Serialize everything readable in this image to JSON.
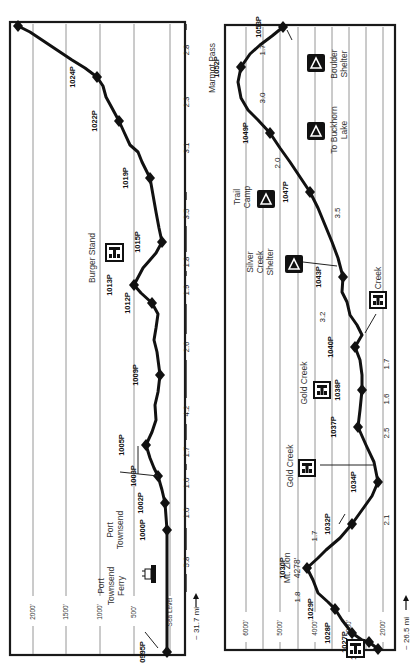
{
  "left_panel": {
    "distance_label": "~ 31.7 mi",
    "elevation_gridlines": [
      {
        "label": "2000'",
        "x": 33
      },
      {
        "label": "1500'",
        "x": 66
      },
      {
        "label": "1000'",
        "x": 100
      },
      {
        "label": "500'",
        "x": 134
      },
      {
        "label": "Sea Level",
        "x": 170
      }
    ],
    "waypoints": [
      {
        "id": "1026P",
        "x": 18,
        "y": 26
      },
      {
        "id": "1024P",
        "x": 97,
        "y": 77
      },
      {
        "id": "1022P",
        "x": 119,
        "y": 121
      },
      {
        "id": "1019P",
        "x": 150,
        "y": 178
      },
      {
        "id": "1015P",
        "x": 162,
        "y": 242
      },
      {
        "id": "1013P",
        "x": 134,
        "y": 285
      },
      {
        "id": "1012P",
        "x": 152,
        "y": 303
      },
      {
        "id": "1009P",
        "x": 160,
        "y": 375
      },
      {
        "id": "1005P",
        "x": 146,
        "y": 445
      },
      {
        "id": "1003P",
        "x": 158,
        "y": 476
      },
      {
        "id": "1002P",
        "x": 165,
        "y": 503
      },
      {
        "id": "1000P",
        "x": 167,
        "y": 530
      },
      {
        "id": "0995P",
        "x": 167,
        "y": 652
      }
    ],
    "segment_miles": [
      "2.8",
      "2.3",
      "3.1",
      "3.5",
      "1.8",
      "1.9",
      "2.6",
      "4.2",
      "1.7",
      "1.0",
      "1.0",
      "5.8"
    ],
    "places": [
      {
        "name": "Burger Stand",
        "icon": "restaurant-icon"
      },
      {
        "name": "Port Townsend",
        "icon": null
      },
      {
        "name": "Port Townsend Ferry",
        "icon": "ferry-icon"
      }
    ]
  },
  "right_panel": {
    "distance_label": "~ 26.5 mi",
    "elevation_gridlines": [
      {
        "label": "6000'",
        "x": 246
      },
      {
        "label": "",
        "x": 263
      },
      {
        "label": "5000'",
        "x": 280
      },
      {
        "label": "",
        "x": 298
      },
      {
        "label": "4000'",
        "x": 315
      },
      {
        "label": "",
        "x": 332
      },
      {
        "label": "3000'",
        "x": 349
      },
      {
        "label": "",
        "x": 366
      },
      {
        "label": "2000'",
        "x": 383
      }
    ],
    "waypoints": [
      {
        "id": "1053P",
        "x": 283,
        "y": 27
      },
      {
        "id": "1052P",
        "x": 241,
        "y": 67
      },
      {
        "id": "1049P",
        "x": 270,
        "y": 133
      },
      {
        "id": "1047P",
        "x": 310,
        "y": 192
      },
      {
        "id": "1043P",
        "x": 343,
        "y": 277
      },
      {
        "id": "1040P",
        "x": 355,
        "y": 347
      },
      {
        "id": "1038P",
        "x": 362,
        "y": 390
      },
      {
        "id": "1037P",
        "x": 358,
        "y": 427
      },
      {
        "id": "1034P",
        "x": 378,
        "y": 482
      },
      {
        "id": "1032P",
        "x": 352,
        "y": 524
      },
      {
        "id": "1030P",
        "x": 307,
        "y": 568
      },
      {
        "id": "1029P",
        "x": 335,
        "y": 609
      },
      {
        "id": "1028P",
        "x": 352,
        "y": 633
      },
      {
        "id": "1027P",
        "x": 369,
        "y": 642
      },
      {
        "id": "1026P",
        "x": 378,
        "y": 649
      }
    ],
    "segment_miles": [
      "1.7",
      "3.0",
      "2.0",
      "3.5",
      "3.2",
      "1.7",
      "1.6",
      "2.5",
      "2.1",
      "1.7",
      "1.8"
    ],
    "places": [
      {
        "name": "Marmot Pass",
        "icon": null
      },
      {
        "name": "Boulder Shelter",
        "icon": "campsite-icon"
      },
      {
        "name": "To Buckhorn Lake",
        "icon": "campsite-icon"
      },
      {
        "name": "Trail Camp",
        "icon": "campsite-icon"
      },
      {
        "name": "Silver Creek Shelter",
        "icon": "campsite-icon"
      },
      {
        "name": "Creek",
        "icon": "restaurant-icon"
      },
      {
        "name": "Gold Creek",
        "icon": "restaurant-icon"
      },
      {
        "name": "Gold Creek",
        "icon": "restaurant-icon"
      },
      {
        "name": "Mt. Zion 4278'",
        "icon": null
      }
    ]
  }
}
